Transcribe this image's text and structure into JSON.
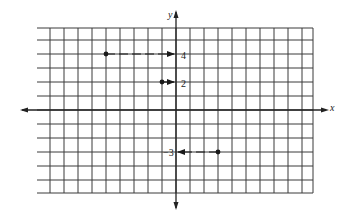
{
  "chart_data": {
    "type": "scatter",
    "title": "",
    "xlabel": "x",
    "ylabel": "y",
    "xlim": [
      -10,
      10
    ],
    "ylim": [
      -6,
      6
    ],
    "grid": true,
    "unit_px": 14,
    "origin_px": [
      176,
      110
    ],
    "points": [
      {
        "x": -5,
        "y": 4,
        "projection_label": "4"
      },
      {
        "x": -1,
        "y": 2,
        "projection_label": "2"
      },
      {
        "x": 3,
        "y": -3,
        "projection_label": "−3"
      }
    ],
    "annotations": [
      "4",
      "2",
      "−3"
    ]
  },
  "axes": {
    "x_label": "x",
    "y_label": "y"
  },
  "labels": {
    "tick_4": "4",
    "tick_2": "2",
    "tick_neg3": "−3"
  },
  "colors": {
    "grid": "#3a3a3a",
    "axis": "#222222",
    "point": "#1a1a1a"
  }
}
